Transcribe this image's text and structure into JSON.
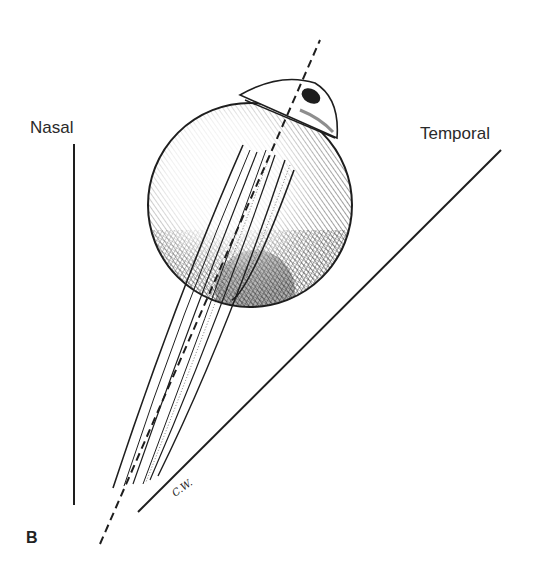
{
  "figure": {
    "panel_label": "B",
    "labels": {
      "nasal": "Nasal",
      "temporal": "Temporal"
    },
    "signature": "C.W.",
    "lines": {
      "nasal_reference": {
        "x1": 74,
        "y1": 144,
        "x2": 74,
        "y2": 505,
        "style": "solid"
      },
      "temporal_reference": {
        "x1": 138,
        "y1": 512,
        "x2": 501,
        "y2": 150,
        "style": "solid"
      },
      "visual_axis": {
        "x1": 100,
        "y1": 544,
        "x2": 320,
        "y2": 40,
        "style": "dashed"
      }
    },
    "colors": {
      "ink": "#1e1e1e",
      "background": "#ffffff"
    }
  }
}
